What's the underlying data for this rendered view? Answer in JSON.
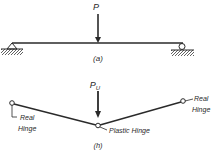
{
  "figure": {
    "part_a": {
      "load_label": "P",
      "caption": "(a)"
    },
    "part_b": {
      "load_label": "P",
      "load_subscript": "U",
      "left_hinge_label_line1": "Real",
      "left_hinge_label_line2": "Hinge",
      "right_hinge_label_line1": "Real",
      "right_hinge_label_line2": "Hinge",
      "middle_hinge_label": "Plastic Hinge",
      "caption": "(h)"
    },
    "colors": {
      "ink": "#2a2a2a",
      "background": "#ffffff"
    }
  }
}
